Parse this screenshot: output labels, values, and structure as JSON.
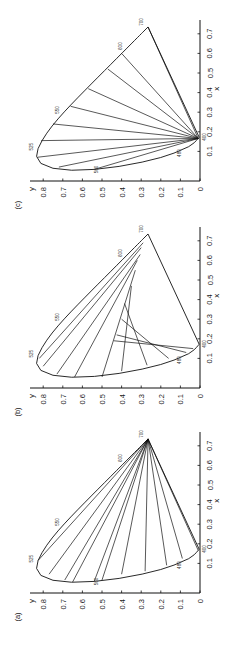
{
  "figure": {
    "orientation": "rotated-90-ccw",
    "panels": [
      {
        "id": "c",
        "label": "(c)",
        "offset": 0
      },
      {
        "id": "b",
        "label": "(b)",
        "offset": 207
      },
      {
        "id": "a",
        "label": "(a)",
        "offset": 412
      }
    ]
  },
  "chart_data": [
    {
      "type": "line",
      "panel": "(a)",
      "title": "",
      "xlabel": "x",
      "ylabel": "y",
      "xlim": [
        0,
        0.75
      ],
      "ylim": [
        0,
        0.85
      ],
      "xticks": [
        0.1,
        0.2,
        0.3,
        0.4,
        0.5,
        0.6,
        0.7
      ],
      "yticks": [
        0,
        0.1,
        0.2,
        0.3,
        0.4,
        0.5,
        0.6,
        0.7,
        0.8
      ],
      "grid": false,
      "spectral_locus_annotations": [
        "400",
        "480",
        "500",
        "525",
        "550",
        "600",
        "700"
      ],
      "description": "CIE 1931 chromaticity diagram; lines radiate from the 700 nm red point to points on the spectral locus",
      "convergence_point": [
        0.735,
        0.265
      ],
      "line_endpoints": [
        [
          0.115,
          0.826
        ],
        [
          0.045,
          0.77
        ],
        [
          0.015,
          0.69
        ],
        [
          0.005,
          0.65
        ],
        [
          0.008,
          0.54
        ],
        [
          0.015,
          0.5
        ],
        [
          0.045,
          0.4
        ],
        [
          0.06,
          0.28
        ],
        [
          0.09,
          0.17
        ],
        [
          0.125,
          0.09
        ],
        [
          0.166,
          0.009
        ]
      ]
    },
    {
      "type": "line",
      "panel": "(b)",
      "title": "",
      "xlabel": "x",
      "ylabel": "y",
      "xlim": [
        0,
        0.75
      ],
      "ylim": [
        0,
        0.85
      ],
      "xticks": [
        0.1,
        0.2,
        0.3,
        0.4,
        0.5,
        0.6,
        0.7
      ],
      "yticks": [
        0,
        0.1,
        0.2,
        0.3,
        0.4,
        0.5,
        0.6,
        0.7,
        0.8
      ],
      "grid": false,
      "spectral_locus_annotations": [
        "400",
        "480",
        "525",
        "550",
        "600",
        "700"
      ],
      "description": "CIE 1931 chromaticity diagram; parallel chords from the spectral locus to the purple line",
      "line_endpoints": [
        [
          [
            0.1,
            0.82
          ],
          [
            0.69,
            0.29
          ]
        ],
        [
          [
            0.06,
            0.8
          ],
          [
            0.665,
            0.3
          ]
        ],
        [
          [
            0.02,
            0.73
          ],
          [
            0.63,
            0.305
          ]
        ],
        [
          [
            0.005,
            0.64
          ],
          [
            0.6,
            0.32
          ]
        ],
        [
          [
            0.005,
            0.5
          ],
          [
            0.55,
            0.33
          ]
        ],
        [
          [
            0.035,
            0.4
          ],
          [
            0.47,
            0.35
          ]
        ],
        [
          [
            0.065,
            0.27
          ],
          [
            0.38,
            0.385
          ]
        ],
        [
          [
            0.1,
            0.16
          ],
          [
            0.3,
            0.4
          ]
        ],
        [
          [
            0.13,
            0.07
          ],
          [
            0.22,
            0.425
          ]
        ],
        [
          [
            0.15,
            0.035
          ],
          [
            0.19,
            0.44
          ]
        ]
      ]
    },
    {
      "type": "line",
      "panel": "(c)",
      "title": "",
      "xlabel": "x",
      "ylabel": "y",
      "xlim": [
        0,
        0.75
      ],
      "ylim": [
        0,
        0.85
      ],
      "xticks": [
        0.1,
        0.2,
        0.3,
        0.4,
        0.5,
        0.6,
        0.7
      ],
      "yticks": [
        0,
        0.1,
        0.2,
        0.3,
        0.4,
        0.5,
        0.6,
        0.7,
        0.8
      ],
      "grid": false,
      "spectral_locus_annotations": [
        "400",
        "480",
        "500",
        "525",
        "550",
        "600",
        "700"
      ],
      "description": "CIE 1931 chromaticity diagram; lines radiate from the 400 nm blue corner to points on the spectral locus",
      "convergence_point": [
        0.166,
        0.009
      ],
      "line_endpoints": [
        [
          0.735,
          0.265
        ],
        [
          0.6,
          0.4
        ],
        [
          0.52,
          0.47
        ],
        [
          0.42,
          0.57
        ],
        [
          0.33,
          0.66
        ],
        [
          0.24,
          0.75
        ],
        [
          0.155,
          0.81
        ],
        [
          0.07,
          0.83
        ],
        [
          0.02,
          0.72
        ],
        [
          0.008,
          0.54
        ]
      ]
    }
  ],
  "axes": {
    "xlabel": "x",
    "ylabel": "y",
    "xtick_labels": [
      "0.1",
      "0.2",
      "0.3",
      "0.4",
      "0.5",
      "0.6",
      "0.7"
    ],
    "ytick_labels": [
      "0",
      "0.1",
      "0.2",
      "0.3",
      "0.4",
      "0.5",
      "0.6",
      "0.7",
      "0.8"
    ]
  }
}
